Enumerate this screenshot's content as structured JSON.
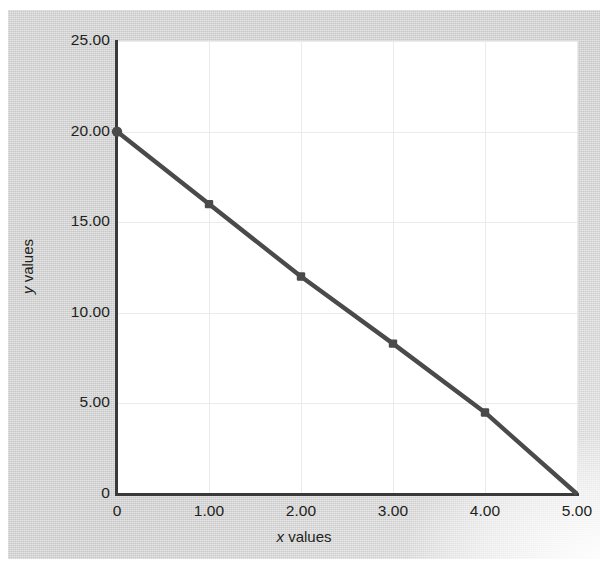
{
  "chart_data": {
    "type": "line",
    "title": "",
    "subtitle": "",
    "xlabel_prefix": "x",
    "xlabel_suffix": " values",
    "ylabel_prefix": "y",
    "ylabel_suffix": " values",
    "xlabel": "x values",
    "ylabel": "y values",
    "x": [
      0,
      1,
      2,
      3,
      4,
      5
    ],
    "values": [
      20.0,
      16.0,
      12.0,
      8.3,
      4.5,
      0.0
    ],
    "series": [
      {
        "name": "",
        "x": [
          0,
          1,
          2,
          3,
          4,
          5
        ],
        "values": [
          20.0,
          16.0,
          12.0,
          8.3,
          4.5,
          0.0
        ]
      }
    ],
    "xlim": [
      0,
      5
    ],
    "ylim": [
      0,
      25
    ],
    "xticks": [
      0,
      1,
      2,
      3,
      4,
      5
    ],
    "xtick_labels": [
      "0",
      "1.00",
      "2.00",
      "3.00",
      "4.00",
      "5.00"
    ],
    "yticks": [
      0,
      5,
      10,
      15,
      20,
      25
    ],
    "ytick_labels": [
      "0",
      "5.00",
      "10.00",
      "15.00",
      "20.00",
      "25.00"
    ],
    "grid": true,
    "grid_color": "#ebebeb",
    "legend": false,
    "legend_position": "none",
    "line_color": "#4a4a4a",
    "marker": "square",
    "marker_color": "#4a4a4a",
    "plot_background": "#ffffff",
    "page_background": "#cfcfcf",
    "axis_color": "#3a3a3a",
    "text_color": "#231f20"
  }
}
